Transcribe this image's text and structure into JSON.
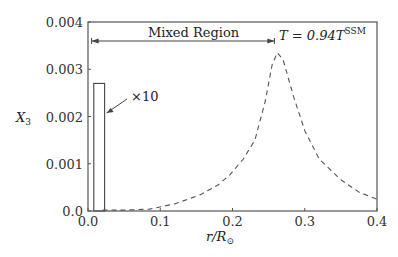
{
  "chart_data": {
    "type": "line",
    "title": "",
    "xlabel": "r/R_⊙",
    "xlabel_parts": {
      "main": "r/R",
      "sub": "⊙"
    },
    "ylabel": "X_3",
    "ylabel_parts": {
      "main": "X",
      "sub": "3"
    },
    "xlim": [
      0.0,
      0.4
    ],
    "ylim": [
      0.0,
      0.004
    ],
    "grid": false,
    "xticks": [
      "0.0",
      "0.1",
      "0.2",
      "0.3",
      "0.4"
    ],
    "xtick_values": [
      0.0,
      0.1,
      0.2,
      0.3,
      0.4
    ],
    "yticks": [
      "0.0",
      "0.001",
      "0.002",
      "0.003",
      "0.004"
    ],
    "ytick_values": [
      0.0,
      0.001,
      0.002,
      0.003,
      0.004
    ],
    "series": [
      {
        "name": "X_3 profile (T = 0.94 T^SSM)",
        "style": "dashed",
        "x": [
          0.02,
          0.05,
          0.085,
          0.12,
          0.155,
          0.18,
          0.196,
          0.215,
          0.231,
          0.245,
          0.255,
          0.262,
          0.27,
          0.285,
          0.3,
          0.32,
          0.35,
          0.375,
          0.4
        ],
        "y": [
          2e-05,
          2e-05,
          4e-05,
          0.00015,
          0.00034,
          0.00055,
          0.00076,
          0.0011,
          0.0015,
          0.0023,
          0.0031,
          0.00335,
          0.0032,
          0.0024,
          0.0017,
          0.0011,
          0.00066,
          0.0004,
          0.00025
        ]
      }
    ],
    "bar": {
      "name": "×10 inset bar",
      "x_range": [
        0.008,
        0.023
      ],
      "value": 0.0027
    },
    "annotations": {
      "region_label": "Mixed Region",
      "region_range": [
        0.005,
        0.258
      ],
      "temperature_label": {
        "main": "T = 0.94T",
        "sup": "SSM"
      },
      "bar_multiplier": "×10"
    }
  }
}
